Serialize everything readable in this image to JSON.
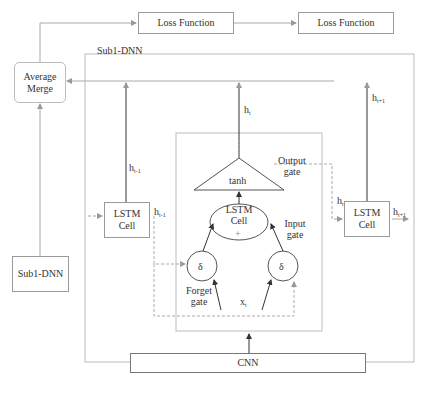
{
  "diagram": {
    "nodes": {
      "loss1": "Loss Function",
      "loss2": "Loss Function",
      "average_merge": "Average Merge",
      "sub1_dnn_container": "Sub1-DNN",
      "sub1_dnn_box": "Sub1-DNN",
      "lstm_left": "LSTM Cell",
      "lstm_right": "LSTM Cell",
      "lstm_center": "LSTM Cell",
      "lstm_center_plus": "+",
      "tanh": "tanh",
      "forget_sigma": "δ",
      "input_sigma": "δ",
      "cnn": "CNN"
    },
    "labels": {
      "output_gate": "Output gate",
      "input_gate": "Input gate",
      "forget_gate": "Forget gate",
      "h": "h",
      "sub_t": "t",
      "sub_t_minus_1": "t-1",
      "sub_t_plus_1": "t+1",
      "x": "x",
      "x_sub": "t"
    },
    "colors": {
      "line": "#555555",
      "light_line": "#b0b0b0",
      "box_border": "#9a9a9a"
    }
  }
}
